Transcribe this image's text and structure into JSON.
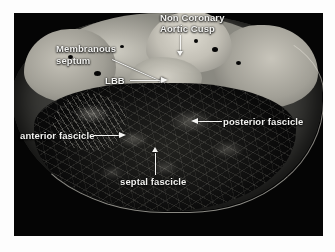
{
  "figure": {
    "kind": "anatomical-photograph",
    "border_color": "#ffffff",
    "plate_background": "#050505",
    "annotation_color": "#f2f2f0"
  },
  "annotations": [
    {
      "id": "non-coronary-aortic-cusp",
      "line1": "Non Coronary",
      "line2": "Aortic Cusp",
      "pointer": "down-arrow"
    },
    {
      "id": "membranous-septum",
      "line1": "Membranous",
      "line2": "septum",
      "pointer": "diagonal-arrow-down-right"
    },
    {
      "id": "lbb",
      "line1": "LBB",
      "pointer": "right-arrow"
    },
    {
      "id": "posterior-fascicle",
      "line1": "posterior fascicle",
      "pointer": "left-arrow"
    },
    {
      "id": "anterior-fascicle",
      "line1": "anterior fascicle",
      "pointer": "right-arrow"
    },
    {
      "id": "septal-fascicle",
      "line1": "septal fascicle",
      "pointer": "up-arrow"
    }
  ]
}
